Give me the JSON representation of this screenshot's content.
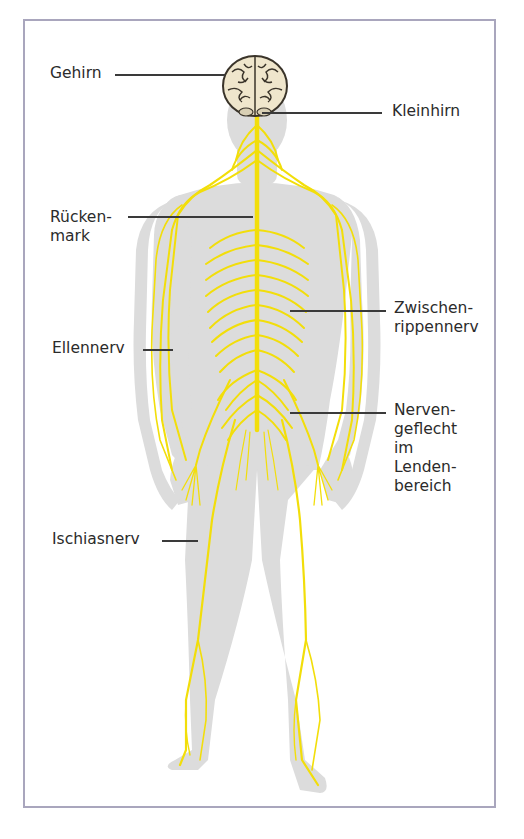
{
  "diagram": {
    "colors": {
      "frame": "#a9a6bd",
      "body": "#dcdcdc",
      "nerve": "#f2de0a",
      "nerve_dark": "#c9b800",
      "brain": "#efe6cc",
      "brain_outline": "#3a342a",
      "label_text": "#2b2b2b",
      "leader_line": "#3a3a3a"
    },
    "labels": [
      {
        "id": "gehirn",
        "text": "Gehirn",
        "side": "left"
      },
      {
        "id": "kleinhirn",
        "text": "Kleinhirn",
        "side": "right"
      },
      {
        "id": "rueckenmark",
        "text": "Rücken-\nmark",
        "side": "left"
      },
      {
        "id": "zwischenrippennerv",
        "text": "Zwischen-\nrippennerv",
        "side": "right"
      },
      {
        "id": "ellennerv",
        "text": "Ellennerv",
        "side": "left"
      },
      {
        "id": "nervengeflecht",
        "text": "Nerven-\ngeflecht\nim\nLenden-\nbereich",
        "side": "right"
      },
      {
        "id": "ischiasnerv",
        "text": "Ischiasnerv",
        "side": "left"
      }
    ]
  }
}
